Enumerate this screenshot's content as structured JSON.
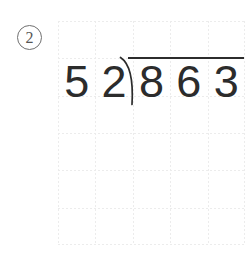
{
  "page": {
    "background_color": "#ffffff",
    "width": 252,
    "height": 255
  },
  "problem": {
    "marker_label": "2",
    "marker_style": "circled-number",
    "type": "long-division"
  },
  "grid": {
    "columns": 5,
    "rows": 6,
    "cell_width": 37.4,
    "cell_height": 37.3,
    "line_color": "#ececec",
    "line_style": "dotted"
  },
  "division": {
    "divisor": "52",
    "dividend": "863",
    "divisor_digits": [
      "5",
      "2"
    ],
    "dividend_digits": [
      "8",
      "6",
      "3"
    ],
    "quotient_digits": [],
    "ink_color": "#2c2c2c",
    "vinculum_label": "division-bar",
    "bracket_label": "division-bracket"
  }
}
